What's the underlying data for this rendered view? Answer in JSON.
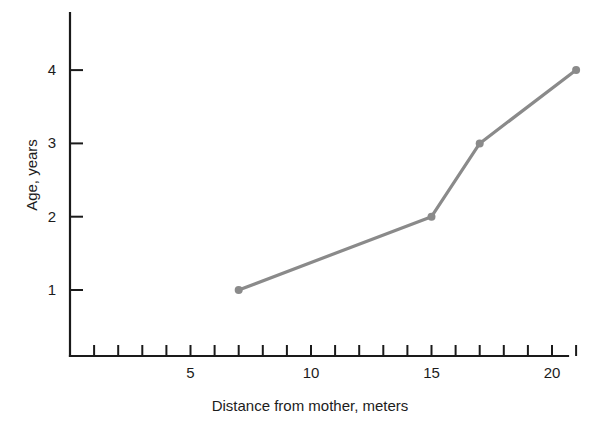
{
  "chart_data": {
    "type": "line",
    "title": "",
    "xlabel": "Distance from mother, meters",
    "ylabel": "Age, years",
    "x": [
      7,
      15,
      17,
      21
    ],
    "values": [
      1,
      2,
      3,
      4
    ],
    "series": [
      {
        "name": "",
        "x": [
          7,
          15,
          17,
          21
        ],
        "values": [
          1,
          2,
          3,
          4
        ]
      }
    ],
    "xlim": [
      0,
      21.5
    ],
    "ylim": [
      0,
      4.7
    ],
    "x_tick_labels": [
      "5",
      "10",
      "15",
      "20"
    ],
    "x_tick_label_values": [
      5,
      10,
      15,
      20
    ],
    "x_minor_ticks": [
      1,
      2,
      3,
      4,
      5,
      6,
      7,
      8,
      9,
      10,
      11,
      12,
      13,
      14,
      15,
      16,
      17,
      18,
      19,
      20,
      21
    ],
    "y_tick_labels": [
      "1",
      "2",
      "3",
      "4"
    ],
    "y_tick_label_values": [
      1,
      2,
      3,
      4
    ],
    "grid": false,
    "legend": false,
    "legend_position": "none",
    "line_color": "#8a8a8a",
    "marker_color": "#8a8a8a",
    "axis_color": "#1a1a1a",
    "background_color": "#ffffff",
    "marker": "circle",
    "tick_direction": "in"
  }
}
